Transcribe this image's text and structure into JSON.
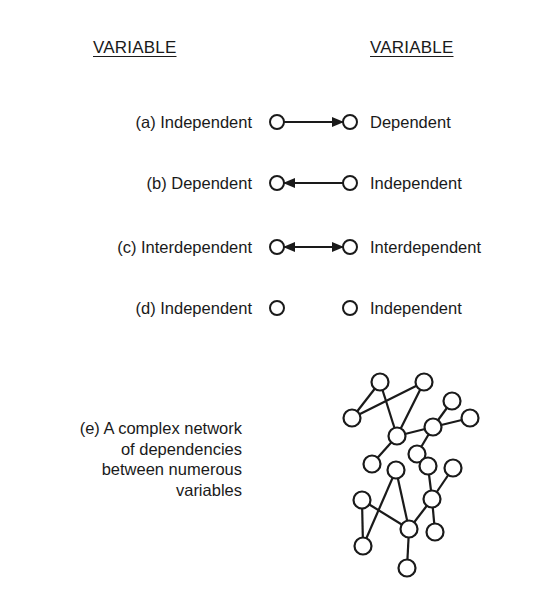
{
  "headers": {
    "left": "VARIABLE",
    "right": "VARIABLE"
  },
  "rows": [
    {
      "id": "a",
      "left": "(a) Independent",
      "right": "Dependent",
      "relation": "left-to-right",
      "y": 122
    },
    {
      "id": "b",
      "left": "(b) Dependent",
      "right": "Independent",
      "relation": "right-to-left",
      "y": 183
    },
    {
      "id": "c",
      "left": "(c) Interdependent",
      "right": "Interdependent",
      "relation": "bidirectional",
      "y": 247
    },
    {
      "id": "d",
      "left": "(d) Independent",
      "right": "Independent",
      "relation": "none",
      "y": 308
    }
  ],
  "network": {
    "description": [
      "(e) A complex network",
      "of dependencies",
      "between numerous",
      "variables"
    ],
    "nodes": {
      "A": [
        380,
        382
      ],
      "B": [
        424,
        382
      ],
      "C": [
        352,
        418
      ],
      "D": [
        397,
        436
      ],
      "E": [
        433,
        427
      ],
      "F": [
        452,
        401
      ],
      "G": [
        470,
        418
      ],
      "H": [
        417,
        454
      ],
      "I": [
        372,
        464
      ],
      "J": [
        396,
        470
      ],
      "K": [
        428,
        466
      ],
      "L": [
        453,
        468
      ],
      "M": [
        362,
        500
      ],
      "N": [
        432,
        499
      ],
      "O": [
        409,
        529
      ],
      "P": [
        435,
        532
      ],
      "Q": [
        363,
        546
      ],
      "R": [
        407,
        568
      ]
    },
    "edges": [
      [
        "A",
        "C"
      ],
      [
        "B",
        "C"
      ],
      [
        "A",
        "D"
      ],
      [
        "B",
        "D"
      ],
      [
        "D",
        "E"
      ],
      [
        "D",
        "I"
      ],
      [
        "E",
        "F"
      ],
      [
        "E",
        "G"
      ],
      [
        "E",
        "H"
      ],
      [
        "H",
        "K"
      ],
      [
        "K",
        "N"
      ],
      [
        "L",
        "N"
      ],
      [
        "N",
        "O"
      ],
      [
        "N",
        "P"
      ],
      [
        "J",
        "Q"
      ],
      [
        "J",
        "O"
      ],
      [
        "M",
        "Q"
      ],
      [
        "M",
        "O"
      ],
      [
        "O",
        "R"
      ]
    ]
  },
  "style": {
    "stroke": "#1a1a1a",
    "background": "#ffffff"
  }
}
